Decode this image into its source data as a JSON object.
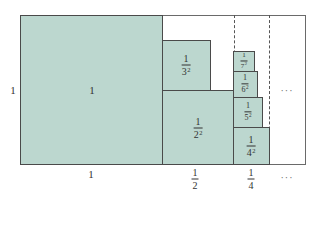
{
  "diagram": {
    "fill_color": "#bcd7cf",
    "side_label": "1",
    "big_square": {
      "label": "1"
    },
    "squares": [
      {
        "id": "2",
        "num": "1",
        "den": "2",
        "exp": "2"
      },
      {
        "id": "3",
        "num": "1",
        "den": "3",
        "exp": "2"
      },
      {
        "id": "4",
        "num": "1",
        "den": "4",
        "exp": "2"
      },
      {
        "id": "5",
        "num": "1",
        "den": "5",
        "exp": "2"
      },
      {
        "id": "6",
        "num": "1",
        "den": "6",
        "exp": "2"
      },
      {
        "id": "7",
        "num": "1",
        "den": "7",
        "exp": "2"
      }
    ],
    "inner_ellipsis": "···",
    "bottom_labels": [
      {
        "text": "1"
      },
      {
        "num": "1",
        "den": "2"
      },
      {
        "num": "1",
        "den": "4"
      },
      {
        "text": "···"
      }
    ]
  }
}
